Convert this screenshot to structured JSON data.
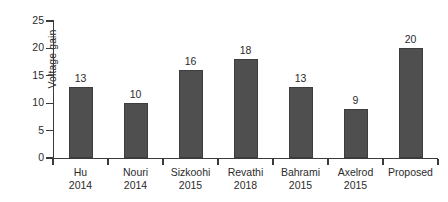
{
  "chart_data": {
    "type": "bar",
    "title": "",
    "subtitle": "",
    "xlabel": "",
    "ylabel": "Voltage gain",
    "categories": [
      "Hu\n2014",
      "Nouri\n2014",
      "Sizkoohi\n2015",
      "Revathi\n2018",
      "Bahrami\n2015",
      "Axelrod\n2015",
      "Proposed"
    ],
    "category_lines": [
      [
        "Hu",
        "2014"
      ],
      [
        "Nouri",
        "2014"
      ],
      [
        "Sizkoohi",
        "2015"
      ],
      [
        "Revathi",
        "2018"
      ],
      [
        "Bahrami",
        "2015"
      ],
      [
        "Axelrod",
        "2015"
      ],
      [
        "Proposed",
        ""
      ]
    ],
    "values": [
      13,
      10,
      16,
      18,
      13,
      9,
      20
    ],
    "data_labels": [
      "13",
      "10",
      "16",
      "18",
      "13",
      "9",
      "20"
    ],
    "ylim": [
      0,
      25
    ],
    "yticks": [
      0,
      5,
      10,
      15,
      20,
      25
    ],
    "ytick_labels": [
      "0",
      "5",
      "10",
      "15",
      "20",
      "25"
    ],
    "grid": false,
    "legend": false,
    "legend_position": "none",
    "bar_color": "#4f4f4f",
    "axis_color": "#3a3a3a",
    "text_color": "#2b2b2b",
    "background_color": "#ffffff"
  }
}
